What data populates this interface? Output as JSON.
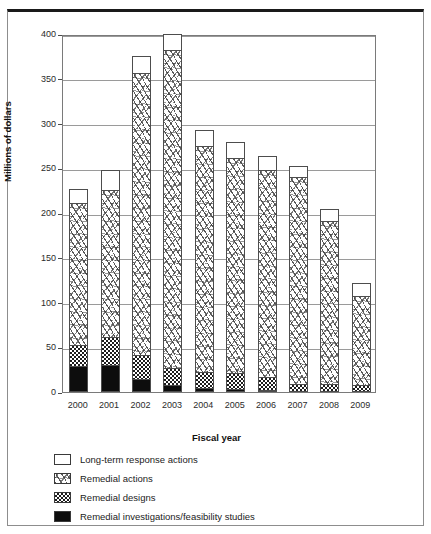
{
  "chart_data": {
    "type": "bar",
    "subtype": "stacked-bar",
    "title": "",
    "xlabel": "Fiscal year",
    "ylabel": "Millions of dollars",
    "categories": [
      "2000",
      "2001",
      "2002",
      "2003",
      "2004",
      "2005",
      "2006",
      "2007",
      "2008",
      "2009"
    ],
    "ylim": [
      0,
      400
    ],
    "ytick_labels": [
      "0",
      "50",
      "100",
      "150",
      "200",
      "250",
      "300",
      "350",
      "400"
    ],
    "ytick_values": [
      0,
      50,
      100,
      150,
      200,
      250,
      300,
      350,
      400
    ],
    "grid": true,
    "grid_axis": "y",
    "legend_position": "below-plot-left",
    "stack_order_bottom_to_top": [
      "Remedial investigations/feasibility studies",
      "Remedial designs",
      "Remedial actions",
      "Long-term response actions"
    ],
    "series": [
      {
        "name": "Remedial investigations/feasibility studies",
        "pattern": "solid-black",
        "color": "#0d0d0d",
        "values": [
          29,
          30,
          14,
          8,
          4,
          3,
          2,
          1,
          1,
          1
        ]
      },
      {
        "name": "Remedial designs",
        "pattern": "checkerboard",
        "color": "#1d1d1d",
        "values": [
          24,
          31,
          27,
          19,
          18,
          18,
          15,
          8,
          8,
          7
        ]
      },
      {
        "name": "Remedial actions",
        "pattern": "random-dashes",
        "color": "#3c3c3c",
        "values": [
          158,
          165,
          315,
          355,
          253,
          240,
          231,
          231,
          182,
          99
        ]
      },
      {
        "name": "Long-term response actions",
        "pattern": "blank-white",
        "color": "#ffffff",
        "values": [
          16,
          22,
          19,
          18,
          18,
          18,
          16,
          12,
          13,
          15
        ]
      }
    ],
    "totals": [
      227,
      248,
      375,
      400,
      293,
      279,
      264,
      252,
      204,
      122
    ]
  },
  "legend": {
    "items": [
      {
        "label": "Long-term response actions",
        "swatch": "blank-white-swatch"
      },
      {
        "label": "Remedial actions",
        "swatch": "dashed-hatch-swatch"
      },
      {
        "label": "Remedial designs",
        "swatch": "checkerboard-swatch"
      },
      {
        "label": "Remedial investigations/feasibility studies",
        "swatch": "solid-black-swatch"
      }
    ]
  }
}
